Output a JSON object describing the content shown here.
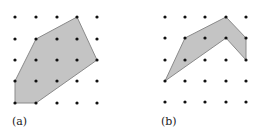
{
  "figures": [
    {
      "id": "a",
      "label": "(a)",
      "grid": {
        "cols": 5,
        "rows": 5,
        "x": [
          15,
          36,
          57,
          77,
          97
        ],
        "y": [
          17,
          39,
          60,
          81,
          103
        ]
      },
      "polygon_grid_vertices": [
        [
          0,
          4
        ],
        [
          1,
          4
        ],
        [
          4,
          2
        ],
        [
          3,
          0
        ],
        [
          1,
          1
        ],
        [
          0,
          3
        ]
      ],
      "label_pos": [
        12,
        117
      ]
    },
    {
      "id": "b",
      "label": "(b)",
      "grid": {
        "cols": 5,
        "rows": 5,
        "x": [
          165,
          185,
          205,
          226,
          246
        ],
        "y": [
          17,
          38,
          60,
          81,
          102
        ]
      },
      "polygon_grid_vertices": [
        [
          0,
          3
        ],
        [
          1,
          1
        ],
        [
          3,
          0
        ],
        [
          4,
          1
        ],
        [
          4,
          2
        ],
        [
          3,
          1
        ]
      ],
      "label_pos": [
        161,
        117
      ]
    }
  ],
  "colors": {
    "fill": "#c4c4c4",
    "stroke": "#8a8a8a",
    "dot": "#111111"
  }
}
